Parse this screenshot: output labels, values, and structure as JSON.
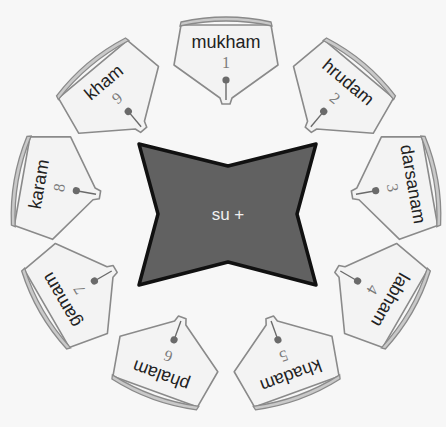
{
  "center": {
    "label": "su +",
    "fill": "#616161",
    "stroke": "#111111"
  },
  "cards": [
    {
      "number": "1",
      "word": "mukham"
    },
    {
      "number": "2",
      "word": "hrudam"
    },
    {
      "number": "3",
      "word": "darsanam"
    },
    {
      "number": "4",
      "word": "labham"
    },
    {
      "number": "5",
      "word": "khadam"
    },
    {
      "number": "6",
      "word": "phalam"
    },
    {
      "number": "7",
      "word": "gamam"
    },
    {
      "number": "8",
      "word": "karam"
    },
    {
      "number": "9",
      "word": "kham"
    }
  ],
  "colors": {
    "background": "#f7f7f7",
    "card_fill": "#f3f3f3",
    "card_outline": "#8a8a8a",
    "rim_fill": "#c9c9c9",
    "word_text": "#222222",
    "number_text": "#7a7a7a",
    "pin": "#6a6a6a"
  }
}
